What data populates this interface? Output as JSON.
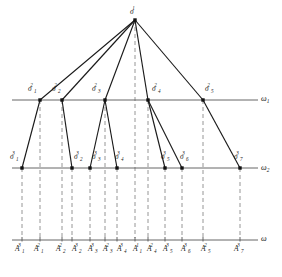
{
  "figure": {
    "kind": "hierarchical-partition-tree",
    "background_color": "#ffffff",
    "edge_color": "#1a1a1a",
    "axis_color": "#555555",
    "dash_color": "#8a8a8a"
  },
  "axes": [
    {
      "id": "omega1",
      "name": "ω",
      "subscript": "1",
      "y": 100,
      "x_start": 12,
      "x_end": 258,
      "label_x": 261,
      "label_y": 95
    },
    {
      "id": "omega2",
      "name": "ω",
      "subscript": "2",
      "y": 168,
      "x_start": 12,
      "x_end": 258,
      "label_x": 261,
      "label_y": 164
    },
    {
      "id": "omega",
      "name": "ω",
      "subscript": "",
      "y": 240,
      "x_start": 12,
      "x_end": 258,
      "label_x": 261,
      "label_y": 235
    }
  ],
  "root": {
    "id": "sigma-1-1",
    "letter": "σ",
    "sub": "",
    "sup": "1",
    "x": 135,
    "y": 20,
    "label_x": 130,
    "label_y": 8
  },
  "level2_nodes": [
    {
      "id": "sigma-1-2",
      "letter": "σ",
      "sub": "1",
      "sup": "2",
      "x": 40,
      "y": 100,
      "label_x": 28,
      "label_y": 85
    },
    {
      "id": "sigma-2-2",
      "letter": "σ",
      "sub": "2",
      "sup": "2",
      "x": 62,
      "y": 100,
      "label_x": 52,
      "label_y": 85
    },
    {
      "id": "sigma-3-2",
      "letter": "σ",
      "sub": "3",
      "sup": "2",
      "x": 105,
      "y": 100,
      "label_x": 92,
      "label_y": 85
    },
    {
      "id": "sigma-4-2",
      "letter": "σ",
      "sub": "4",
      "sup": "2",
      "x": 148,
      "y": 100,
      "label_x": 152,
      "label_y": 85
    },
    {
      "id": "sigma-5-2",
      "letter": "σ",
      "sub": "5",
      "sup": "2",
      "x": 203,
      "y": 100,
      "label_x": 205,
      "label_y": 85
    }
  ],
  "level3_nodes": [
    {
      "id": "sigma-1-3",
      "letter": "σ",
      "sub": "1",
      "sup": "3",
      "x": 22,
      "y": 168,
      "label_x": 10,
      "label_y": 153
    },
    {
      "id": "sigma-2-3",
      "letter": "σ",
      "sub": "2",
      "sup": "3",
      "x": 72,
      "y": 168,
      "label_x": 74,
      "label_y": 153
    },
    {
      "id": "sigma-3-3",
      "letter": "σ",
      "sub": "3",
      "sup": "3",
      "x": 90,
      "y": 168,
      "label_x": 92,
      "label_y": 153
    },
    {
      "id": "sigma-4-3",
      "letter": "σ",
      "sub": "4",
      "sup": "3",
      "x": 117,
      "y": 168,
      "label_x": 115,
      "label_y": 153
    },
    {
      "id": "sigma-5-3",
      "letter": "σ",
      "sub": "5",
      "sup": "3",
      "x": 165,
      "y": 168,
      "label_x": 161,
      "label_y": 153
    },
    {
      "id": "sigma-6-3",
      "letter": "σ",
      "sub": "6",
      "sup": "3",
      "x": 182,
      "y": 168,
      "label_x": 180,
      "label_y": 153
    },
    {
      "id": "sigma-7-3",
      "letter": "σ",
      "sub": "7",
      "sup": "3",
      "x": 240,
      "y": 168,
      "label_x": 234,
      "label_y": 153
    }
  ],
  "edges_root_to_level2": [
    {
      "from": "sigma-1-1",
      "to": "sigma-1-2"
    },
    {
      "from": "sigma-1-1",
      "to": "sigma-2-2"
    },
    {
      "from": "sigma-1-1",
      "to": "sigma-3-2"
    },
    {
      "from": "sigma-1-1",
      "to": "sigma-4-2"
    },
    {
      "from": "sigma-1-1",
      "to": "sigma-5-2"
    }
  ],
  "edges_level2_to_level3": [
    {
      "from": "sigma-1-2",
      "to": "sigma-1-3"
    },
    {
      "from": "sigma-2-2",
      "to": "sigma-2-3"
    },
    {
      "from": "sigma-3-2",
      "to": "sigma-3-3"
    },
    {
      "from": "sigma-3-2",
      "to": "sigma-4-3"
    },
    {
      "from": "sigma-4-2",
      "to": "sigma-5-3"
    },
    {
      "from": "sigma-4-2",
      "to": "sigma-6-3"
    },
    {
      "from": "sigma-5-2",
      "to": "sigma-7-3"
    }
  ],
  "omega_axis_ticks": [
    {
      "id": "A-1-3",
      "letter": "A",
      "sub": "1",
      "sup": "3",
      "x": 22,
      "label_x": 15,
      "label_y": 245
    },
    {
      "id": "A-1-2",
      "letter": "A",
      "sub": "1",
      "sup": "2",
      "x": 40,
      "label_x": 34,
      "label_y": 245
    },
    {
      "id": "A-2-2",
      "letter": "A",
      "sub": "2",
      "sup": "2",
      "x": 62,
      "label_x": 56,
      "label_y": 245
    },
    {
      "id": "A-2-3",
      "letter": "A",
      "sub": "2",
      "sup": "3",
      "x": 72,
      "label_x": 72,
      "label_y": 245
    },
    {
      "id": "A-3-3",
      "letter": "A",
      "sub": "3",
      "sup": "3",
      "x": 90,
      "label_x": 88,
      "label_y": 245
    },
    {
      "id": "A-3-2",
      "letter": "A",
      "sub": "3",
      "sup": "2",
      "x": 105,
      "label_x": 103,
      "label_y": 245
    },
    {
      "id": "A-4-3",
      "letter": "A",
      "sub": "4",
      "sup": "3",
      "x": 117,
      "label_x": 117,
      "label_y": 245
    },
    {
      "id": "A-1-1",
      "letter": "A",
      "sub": "1",
      "sup": "1",
      "x": 135,
      "label_x": 133,
      "label_y": 245
    },
    {
      "id": "A-4-2",
      "letter": "A",
      "sub": "4",
      "sup": "2",
      "x": 148,
      "label_x": 147,
      "label_y": 245
    },
    {
      "id": "A-5-3",
      "letter": "A",
      "sub": "5",
      "sup": "3",
      "x": 165,
      "label_x": 163,
      "label_y": 245
    },
    {
      "id": "A-6-3",
      "letter": "A",
      "sub": "6",
      "sup": "3",
      "x": 182,
      "label_x": 181,
      "label_y": 245
    },
    {
      "id": "A-5-2",
      "letter": "A",
      "sub": "5",
      "sup": "2",
      "x": 203,
      "label_x": 201,
      "label_y": 245
    },
    {
      "id": "A-7-3",
      "letter": "A",
      "sub": "7",
      "sup": "3",
      "x": 240,
      "label_x": 234,
      "label_y": 245
    }
  ],
  "drop_lines": [
    {
      "x": 22,
      "y_top": 168,
      "y_bottom": 238
    },
    {
      "x": 40,
      "y_top": 100,
      "y_bottom": 238
    },
    {
      "x": 62,
      "y_top": 100,
      "y_bottom": 238
    },
    {
      "x": 72,
      "y_top": 168,
      "y_bottom": 238
    },
    {
      "x": 90,
      "y_top": 168,
      "y_bottom": 238
    },
    {
      "x": 105,
      "y_top": 100,
      "y_bottom": 238
    },
    {
      "x": 117,
      "y_top": 168,
      "y_bottom": 238
    },
    {
      "x": 135,
      "y_top": 20,
      "y_bottom": 238
    },
    {
      "x": 148,
      "y_top": 100,
      "y_bottom": 238
    },
    {
      "x": 165,
      "y_top": 168,
      "y_bottom": 238
    },
    {
      "x": 182,
      "y_top": 168,
      "y_bottom": 238
    },
    {
      "x": 203,
      "y_top": 100,
      "y_bottom": 238
    },
    {
      "x": 240,
      "y_top": 168,
      "y_bottom": 238
    }
  ]
}
